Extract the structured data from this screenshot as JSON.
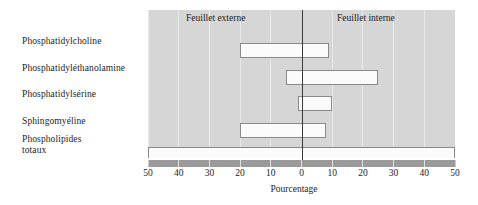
{
  "categories": {
    "items": [
      {
        "label": "Phosphatidylcholine"
      },
      {
        "label": "Phosphatidyléthanolamine"
      },
      {
        "label": "Phosphatidylsérine"
      },
      {
        "label": "Sphingomyéline"
      },
      {
        "label": "Phospholipides"
      },
      {
        "label": "totaux"
      }
    ]
  },
  "regions": {
    "left_label": "Feuillet externe",
    "right_label": "Feuillet interne"
  },
  "axis": {
    "title": "Pourcentage",
    "tick_labels": [
      "50",
      "40",
      "30",
      "20",
      "10",
      "0",
      "10",
      "20",
      "30",
      "40",
      "50"
    ]
  },
  "colors": {
    "plot_background": "#d6d6d6",
    "gridline": "#e9e9e9",
    "zero_line": "#3a3a3a",
    "bar_fill": "#fbfbfb",
    "bar_outline": "#8a8a8a",
    "axis_strip": "#9a9a9a",
    "text": "#1c1c1c",
    "page_background": "#ffffff"
  },
  "chart_data": {
    "type": "bar",
    "orientation": "horizontal",
    "title": "",
    "subtitle": "",
    "xlabel": "Pourcentage",
    "ylabel": "",
    "xlim": [
      -50,
      50
    ],
    "xticks": [
      -50,
      -40,
      -30,
      -20,
      -10,
      0,
      10,
      20,
      30,
      40,
      50
    ],
    "xticklabels": [
      "50",
      "40",
      "30",
      "20",
      "10",
      "0",
      "10",
      "20",
      "30",
      "40",
      "50"
    ],
    "grid": true,
    "legend": null,
    "annotations": [
      {
        "text": "Feuillet externe",
        "side": "left"
      },
      {
        "text": "Feuillet interne",
        "side": "right"
      }
    ],
    "note": "Each bar is a floating (range) bar spanning from its outer-leaflet value (negative side) to its inner-leaflet value (positive side).",
    "categories": [
      "Phosphatidylcholine",
      "Phosphatidyléthanolamine",
      "Phosphatidylsérine",
      "Sphingomyéline",
      "Phospholipides totaux"
    ],
    "bars": [
      {
        "category": "Phosphatidylcholine",
        "start": -20,
        "end": 9,
        "outer": 20,
        "inner": 9
      },
      {
        "category": "Phosphatidyléthanolamine",
        "start": -5,
        "end": 25,
        "outer": 5,
        "inner": 25
      },
      {
        "category": "Phosphatidylsérine",
        "start": -1,
        "end": 10,
        "outer": 1,
        "inner": 10
      },
      {
        "category": "Sphingomyéline",
        "start": -20,
        "end": 8,
        "outer": 20,
        "inner": 8
      },
      {
        "category": "Phospholipides totaux",
        "start": -50,
        "end": 50,
        "outer": 50,
        "inner": 50
      }
    ]
  }
}
